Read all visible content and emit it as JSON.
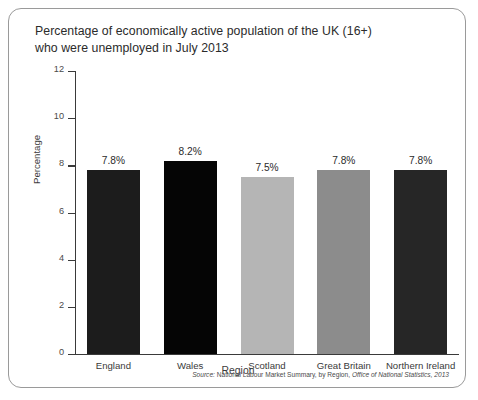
{
  "chart_title": "Percentage of economically active population of the UK (16+)\nwho were unemployed in July 2013",
  "axis": {
    "y_title": "Percentage",
    "x_title": "Region",
    "y_ticks": [
      "0",
      "2",
      "4",
      "6",
      "8",
      "10",
      "12"
    ]
  },
  "source": {
    "lead": "Source:",
    "body": " National Labour Market Summary, by Region, ",
    "publisher": "Office of National Statistics, 2013"
  },
  "chart_data": {
    "type": "bar",
    "title": "Percentage of economically active population of the UK (16+) who were unemployed in July 2013",
    "xlabel": "Region",
    "ylabel": "Percentage",
    "ylim": [
      0,
      12
    ],
    "ytick_step": 2,
    "grid": false,
    "legend": "none",
    "categories": [
      "England",
      "Wales",
      "Scotland",
      "Great Britain",
      "Northern Ireland"
    ],
    "values": [
      7.8,
      8.2,
      7.5,
      7.8,
      7.8
    ],
    "value_labels": [
      "7.8%",
      "8.2%",
      "7.5%",
      "7.8%",
      "7.8%"
    ],
    "bar_colors": [
      "#1c1c1c",
      "#050505",
      "#b5b5b5",
      "#8c8c8c",
      "#262626"
    ]
  }
}
